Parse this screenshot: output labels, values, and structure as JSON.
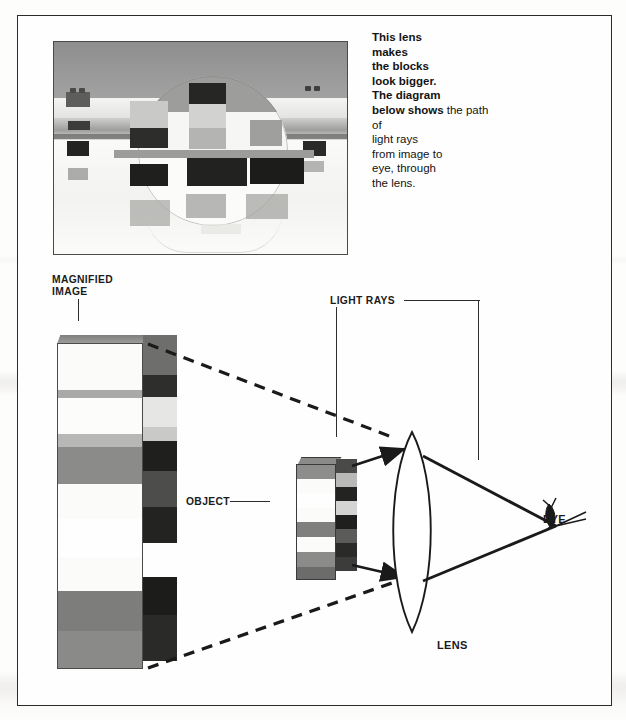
{
  "figure": {
    "kind": "optics-diagram",
    "caption_column": {
      "paragraph1_bold": "This lens\nmakes\nthe blocks\nlook bigger.",
      "paragraph2_bold": "The diagram\nbelow shows",
      "paragraph2_regular": "the path of\nlight rays\nfrom image to\neye, through\nthe lens."
    },
    "labels": {
      "magnified_image": "MAGNIFIED\nIMAGE",
      "light_rays": "LIGHT RAYS",
      "object": "OBJECT",
      "eye": "EYE",
      "lens": "LENS"
    },
    "photo": {
      "subject": "magnifying lens held above a row of toy blocks",
      "blocks_through_lens": 4,
      "blocks_outside_lens": 3
    },
    "magnified_tower": {
      "band_count": 10,
      "front_bands": [
        "#fbfbf9",
        "#f7f7f5",
        "#8f8f8d",
        "#8b8b89",
        "#fbfbf9",
        "#6f6f6d",
        "#fbfbf9",
        "#7c7c7a",
        "#fbfbf9",
        "#8a8a88"
      ],
      "side_bands": [
        "#6e6e6c",
        "#3b3b3a",
        "#e9e9e7",
        "#232322",
        "#5a5a58",
        "#2a2a29",
        "#56565 4",
        "#1d1d1c",
        "#616160",
        "#262625"
      ]
    },
    "object_block": {
      "band_count": 8,
      "front_bands": [
        "#8d8d8b",
        "#fbfbf9",
        "#87878 5",
        "#fbfbf9",
        "#7f7f7d",
        "#fbfbf9",
        "#8b8b89",
        "#6c6c6a"
      ],
      "side_bands": [
        "#4a4a49",
        "#b9b9b7",
        "#232322",
        "#d8d8d6",
        "#1f1f1e",
        "#5b5b59",
        "#2a2a29",
        "#3c3c3b"
      ]
    },
    "colors": {
      "ink": "#1b1b1b",
      "frame": "#2b2b2b",
      "paper": "#fefefe",
      "ray_stroke": "#1a1a1a"
    }
  }
}
